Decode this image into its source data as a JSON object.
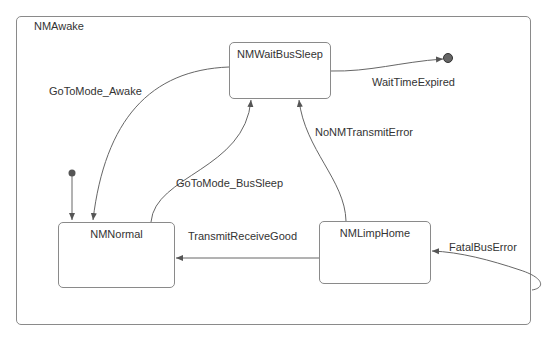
{
  "diagram": {
    "type": "state-machine",
    "container": {
      "name": "NMAwake"
    },
    "states": [
      {
        "id": "wait",
        "name": "NMWaitBusSleep"
      },
      {
        "id": "normal",
        "name": "NMNormal"
      },
      {
        "id": "limp",
        "name": "NMLimpHome"
      }
    ],
    "transitions": [
      {
        "from": "wait",
        "to": "normal",
        "label": "GoToMode_Awake"
      },
      {
        "from": "normal",
        "to": "wait",
        "label": "GoToMode_BusSleep"
      },
      {
        "from": "wait",
        "to": "final",
        "label": "WaitTimeExpired"
      },
      {
        "from": "limp",
        "to": "wait",
        "label": "NoNMTransmitError"
      },
      {
        "from": "limp",
        "to": "normal",
        "label": "TransmitReceiveGood"
      },
      {
        "from": "external",
        "to": "limp",
        "label": "FatalBusError"
      },
      {
        "from": "initial",
        "to": "normal",
        "label": ""
      }
    ],
    "colors": {
      "line": "#555555",
      "border": "#8a8a8a",
      "dot": "#555555",
      "text": "#333333"
    }
  }
}
